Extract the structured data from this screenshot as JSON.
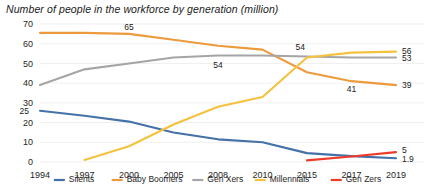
{
  "chart_data": {
    "type": "line",
    "title": "Number of people in the workforce by generation (million)",
    "xlabel": "",
    "ylabel": "",
    "grid": true,
    "legend_position": "bottom",
    "categories": [
      "1994",
      "1997",
      "2000",
      "2005",
      "2008",
      "2010",
      "2015",
      "2017",
      "2019"
    ],
    "x": [
      1994,
      1997,
      2000,
      2005,
      2008,
      2010,
      2015,
      2017,
      2019
    ],
    "ylim": [
      0,
      70
    ],
    "yticks": [
      0,
      10,
      20,
      30,
      40,
      50,
      60,
      70
    ],
    "xlim": [
      1994,
      2019
    ],
    "series": [
      {
        "name": "Silents",
        "color": "#4472A8",
        "x": [
          1994,
          1997,
          2000,
          2005,
          2008,
          2010,
          2015,
          2017,
          2019
        ],
        "values": [
          26,
          23.5,
          20.5,
          15,
          11.5,
          10,
          4.5,
          3,
          1.9
        ]
      },
      {
        "name": "Baby Boomers",
        "color": "#ED9A3C",
        "x": [
          1994,
          1997,
          2000,
          2005,
          2008,
          2010,
          2015,
          2017,
          2019
        ],
        "values": [
          65.5,
          65.5,
          65,
          62,
          59,
          57,
          45.5,
          41,
          39
        ]
      },
      {
        "name": "Gen Xers",
        "color": "#A5A5A5",
        "x": [
          1994,
          1997,
          2000,
          2005,
          2008,
          2010,
          2015,
          2017,
          2019
        ],
        "values": [
          39,
          47,
          50,
          53,
          54,
          54,
          53.5,
          53,
          53
        ]
      },
      {
        "name": "Millennials",
        "color": "#F5C23E",
        "x": [
          1997,
          2000,
          2005,
          2008,
          2010,
          2015,
          2017,
          2019
        ],
        "values": [
          1,
          8,
          19,
          28,
          33,
          53,
          55.5,
          56
        ]
      },
      {
        "name": "Gen Zers",
        "color": "#ED3B2A",
        "x": [
          2015,
          2017,
          2019
        ],
        "values": [
          0.8,
          2.8,
          5
        ]
      }
    ],
    "annotations": [
      {
        "text": "25",
        "x": 1994,
        "y": 26,
        "dx": -11,
        "dy": 3,
        "series": "Silents"
      },
      {
        "text": "1.9",
        "x": 2019,
        "y": 1.9,
        "dx": 6,
        "dy": 4,
        "series": "Silents"
      },
      {
        "text": "65",
        "x": 2000,
        "y": 65,
        "dx": 0,
        "dy": -4,
        "series": "Baby Boomers"
      },
      {
        "text": "41",
        "x": 2017,
        "y": 41,
        "dx": 0,
        "dy": 11,
        "series": "Baby Boomers"
      },
      {
        "text": "39",
        "x": 2019,
        "y": 39,
        "dx": 6,
        "dy": 3,
        "series": "Baby Boomers"
      },
      {
        "text": "54",
        "x": 2008,
        "y": 54,
        "dx": 0,
        "dy": 12,
        "series": "Gen Xers"
      },
      {
        "text": "53",
        "x": 2019,
        "y": 53,
        "dx": 6,
        "dy": 3,
        "series": "Gen Xers"
      },
      {
        "text": "54",
        "x": 2015,
        "y": 53,
        "dx": -2,
        "dy": -8,
        "series": "Millennials"
      },
      {
        "text": "56",
        "x": 2019,
        "y": 56,
        "dx": 6,
        "dy": 2,
        "series": "Millennials"
      },
      {
        "text": "5",
        "x": 2019,
        "y": 5,
        "dx": 6,
        "dy": 1,
        "series": "Gen Zers"
      }
    ]
  }
}
